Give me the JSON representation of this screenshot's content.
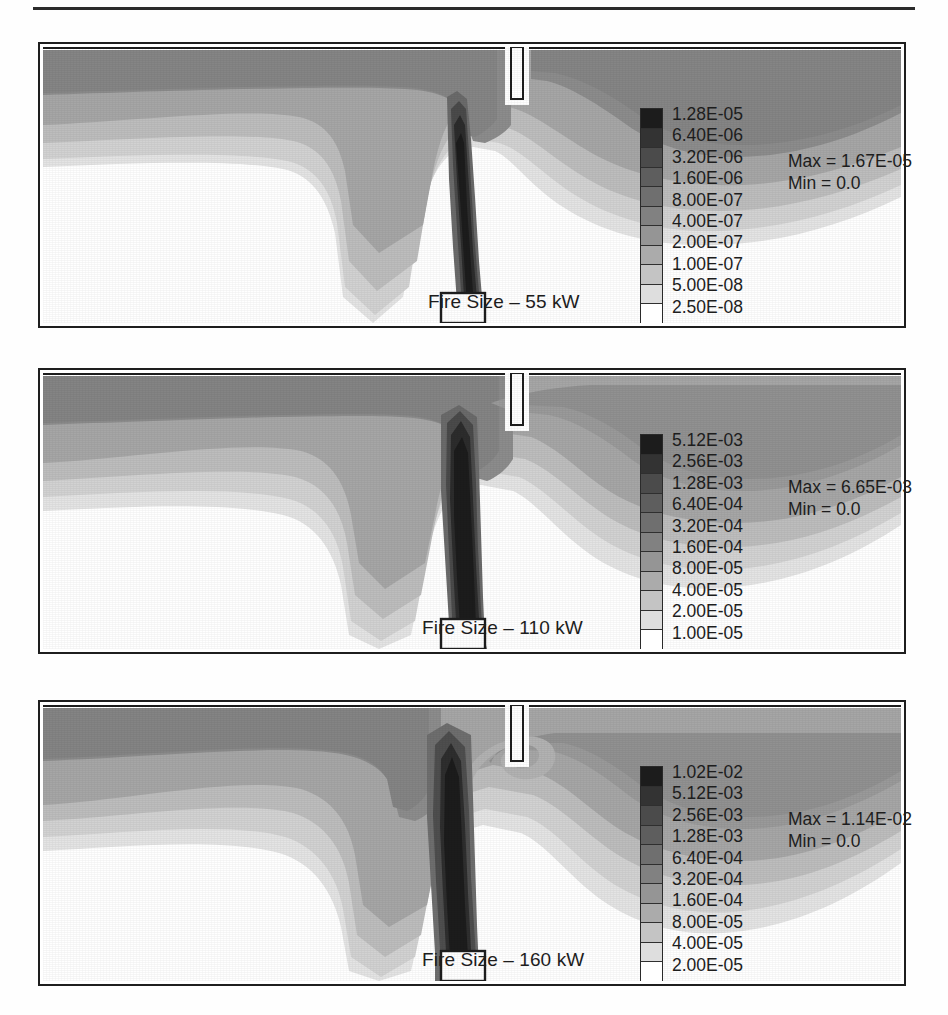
{
  "figure": {
    "type": "contour-plot-series",
    "panel_count": 3
  },
  "panels": [
    {
      "fire_size_label": "Fire Size – 55 kW",
      "legend": {
        "labels": [
          "1.28E-05",
          "6.40E-06",
          "3.20E-06",
          "1.60E-06",
          "8.00E-07",
          "4.00E-07",
          "2.00E-07",
          "1.00E-07",
          "5.00E-08",
          "2.50E-08"
        ],
        "max_label": "Max = 1.67E-05",
        "min_label": "Min = 0.0"
      }
    },
    {
      "fire_size_label": "Fire Size – 110 kW",
      "legend": {
        "labels": [
          "5.12E-03",
          "2.56E-03",
          "1.28E-03",
          "6.40E-04",
          "3.20E-04",
          "1.60E-04",
          "8.00E-05",
          "4.00E-05",
          "2.00E-05",
          "1.00E-05"
        ],
        "max_label": "Max = 6.65E-03",
        "min_label": "Min = 0.0"
      }
    },
    {
      "fire_size_label": "Fire Size – 160 kW",
      "legend": {
        "labels": [
          "1.02E-02",
          "5.12E-03",
          "2.56E-03",
          "1.28E-03",
          "6.40E-04",
          "3.20E-04",
          "1.60E-04",
          "8.00E-05",
          "4.00E-05",
          "2.00E-05"
        ],
        "max_label": "Max = 1.14E-02",
        "min_label": "Min = 0.0"
      }
    }
  ],
  "legend_colors": [
    "#1c1c1c",
    "#333333",
    "#4b4b4b",
    "#5e5e5e",
    "#6f6f6f",
    "#818181",
    "#959595",
    "#ababab",
    "#c4c4c4",
    "#dedede",
    "#ffffff"
  ],
  "chart_data": {
    "type": "heatmap",
    "xlabel": "",
    "ylabel": "",
    "panels": [
      {
        "name": "Fire Size – 55 kW",
        "contour_levels": [
          1.28e-05,
          6.4e-06,
          3.2e-06,
          1.6e-06,
          8e-07,
          4e-07,
          2e-07,
          1e-07,
          5e-08,
          2.5e-08
        ],
        "max": 1.67e-05,
        "min": 0.0
      },
      {
        "name": "Fire Size – 110 kW",
        "contour_levels": [
          0.00512,
          0.00256,
          0.00128,
          0.00064,
          0.00032,
          0.00016,
          8e-05,
          4e-05,
          2e-05,
          1e-05
        ],
        "max": 0.00665,
        "min": 0.0
      },
      {
        "name": "Fire Size – 160 kW",
        "contour_levels": [
          0.0102,
          0.00512,
          0.00256,
          0.00128,
          0.00064,
          0.00032,
          0.00016,
          8e-05,
          4e-05,
          2e-05
        ],
        "max": 0.0114,
        "min": 0.0
      }
    ],
    "grid": false,
    "legend_position": "right-inside"
  }
}
